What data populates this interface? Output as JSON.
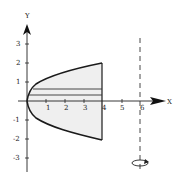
{
  "diagram": {
    "axes": {
      "x_label": "X",
      "y_label": "Y",
      "x_ticks": [
        "1",
        "2",
        "3",
        "4",
        "5",
        "6"
      ],
      "y_ticks_pos": [
        "1",
        "2",
        "3"
      ],
      "y_ticks_neg": [
        "-1",
        "-2",
        "-3"
      ]
    },
    "region": {
      "curve": "x = y^2",
      "right_bound": "x = 4",
      "y_range": [
        -2,
        2
      ],
      "fill_color": "#f0f0f0"
    },
    "axis_of_rotation": {
      "line": "x = 6",
      "style": "dashed"
    },
    "strip": {
      "y_low": 0.3,
      "y_high": 0.6,
      "note": "representative horizontal strip"
    },
    "colors": {
      "stroke": "#1a1a1a",
      "fill": "#eeeeee"
    }
  }
}
